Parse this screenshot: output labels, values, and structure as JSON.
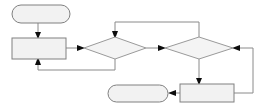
{
  "diagram": {
    "type": "flowchart",
    "title": "",
    "canvas": {
      "width": 269,
      "height": 109,
      "background": "#ffffff"
    },
    "style": {
      "node_fill": "#f2f2f2",
      "node_stroke": "#808080",
      "decision_fill": "#f4f4f4",
      "decision_stroke": "#9a9a9a",
      "connector_stroke": "#8a8a8a",
      "arrowhead_fill": "#0d0d0d"
    },
    "nodes": [
      {
        "id": "start-terminal",
        "name": "start-terminal",
        "shape": "rounded-rectangle",
        "label": "",
        "x": 12,
        "y": 5,
        "width": 58,
        "height": 18
      },
      {
        "id": "process-left",
        "name": "process-left",
        "shape": "rectangle",
        "label": "",
        "x": 12,
        "y": 38,
        "width": 54,
        "height": 21
      },
      {
        "id": "decision-first",
        "name": "decision-first",
        "shape": "diamond",
        "label": "",
        "x": 84,
        "y": 37,
        "width": 62,
        "height": 22
      },
      {
        "id": "decision-second",
        "name": "decision-second",
        "shape": "diamond",
        "label": "",
        "x": 165,
        "y": 37,
        "width": 68,
        "height": 22
      },
      {
        "id": "process-bottom-right",
        "name": "process-bottom-right",
        "shape": "rectangle",
        "label": "",
        "x": 180,
        "y": 84,
        "width": 54,
        "height": 18
      },
      {
        "id": "end-terminal",
        "name": "end-terminal",
        "shape": "rounded-rectangle",
        "label": "",
        "x": 108,
        "y": 85,
        "width": 60,
        "height": 17
      }
    ],
    "connectors": [
      {
        "id": "start-to-process-left",
        "name": "connector-start-to-process-left",
        "from": "start-terminal",
        "to": "process-left",
        "label": "",
        "path": "M 38 23 L 38 36",
        "arrow_at": {
          "x": 38,
          "y": 38,
          "dir": "down"
        }
      },
      {
        "id": "process-left-to-decision-first",
        "name": "connector-process-left-to-decision-first",
        "from": "process-left",
        "to": "decision-first",
        "label": "",
        "path": "M 66 48 L 82 48",
        "arrow_at": {
          "x": 84,
          "y": 48,
          "dir": "right"
        }
      },
      {
        "id": "decision-first-to-decision-second",
        "name": "connector-decision-first-to-decision-second",
        "from": "decision-first",
        "to": "decision-second",
        "label": "",
        "path": "M 146 48 L 163 48",
        "arrow_at": {
          "x": 165,
          "y": 48,
          "dir": "right"
        }
      },
      {
        "id": "decision-first-loopback",
        "name": "connector-decision-first-loopback-to-process-left",
        "from": "decision-first",
        "to": "process-left",
        "label": "",
        "path": "M 115 59 L 115 70 L 38 70 L 38 61",
        "arrow_at": {
          "x": 38,
          "y": 59,
          "dir": "up"
        }
      },
      {
        "id": "decision-second-to-process-bottom-right",
        "name": "connector-decision-second-to-process-bottom-right",
        "from": "decision-second",
        "to": "process-bottom-right",
        "label": "",
        "path": "M 199 59 L 199 82",
        "arrow_at": {
          "x": 199,
          "y": 84,
          "dir": "down"
        }
      },
      {
        "id": "process-bottom-right-to-end",
        "name": "connector-process-bottom-right-to-end-terminal",
        "from": "process-bottom-right",
        "to": "end-terminal",
        "label": "",
        "path": "M 180 93 L 172 93",
        "arrow_at": {
          "x": 168,
          "y": 93,
          "dir": "left"
        }
      },
      {
        "id": "process-bottom-right-loopback",
        "name": "connector-process-bottom-right-loopback-to-decision-second",
        "from": "process-bottom-right",
        "to": "decision-second",
        "label": "",
        "path": "M 234 93 L 253 93 L 253 48 L 235 48",
        "arrow_at": {
          "x": 233,
          "y": 48,
          "dir": "left"
        }
      },
      {
        "id": "decision-second-top-loopback",
        "name": "connector-decision-second-top-loopback-to-decision-first",
        "from": "decision-second",
        "to": "decision-first",
        "label": "",
        "path": "M 199 37 L 199 22 L 115 22 L 115 35",
        "arrow_at": {
          "x": 115,
          "y": 37,
          "dir": "down"
        }
      }
    ]
  }
}
